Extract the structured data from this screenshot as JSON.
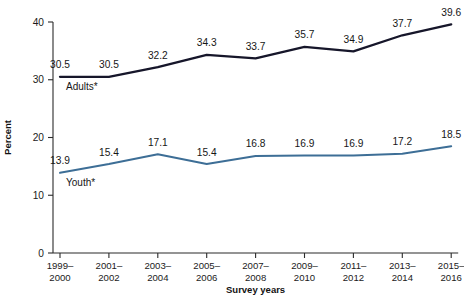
{
  "chart_data": {
    "type": "line",
    "title": "",
    "xlabel": "Survey years",
    "ylabel": "Percent",
    "ylim": [
      0,
      40
    ],
    "yticks": [
      0,
      10,
      20,
      30,
      40
    ],
    "grid": false,
    "legend_position": "inline-labels",
    "categories": [
      "1999–2000",
      "2001–2002",
      "2003–2004",
      "2005–2006",
      "2007–2008",
      "2009–2010",
      "2011–2012",
      "2013–2014",
      "2015–2016"
    ],
    "categories_lines": [
      [
        "1999–",
        "2000"
      ],
      [
        "2001–",
        "2002"
      ],
      [
        "2003–",
        "2004"
      ],
      [
        "2005–",
        "2006"
      ],
      [
        "2007–",
        "2008"
      ],
      [
        "2009–",
        "2010"
      ],
      [
        "2011–",
        "2012"
      ],
      [
        "2013–",
        "2014"
      ],
      [
        "2015–",
        "2016"
      ]
    ],
    "series": [
      {
        "name": "Adults*",
        "color": "#16162a",
        "values": [
          30.5,
          30.5,
          32.2,
          34.3,
          33.7,
          35.7,
          34.9,
          37.7,
          39.6
        ],
        "labels": [
          "30.5",
          "30.5",
          "32.2",
          "34.3",
          "33.7",
          "35.7",
          "34.9",
          "37.7",
          "39.6"
        ]
      },
      {
        "name": "Youth*",
        "color": "#3d6e96",
        "values": [
          13.9,
          15.4,
          17.1,
          15.4,
          16.8,
          16.9,
          16.9,
          17.2,
          18.5
        ],
        "labels": [
          "13.9",
          "15.4",
          "17.1",
          "15.4",
          "16.8",
          "16.9",
          "16.9",
          "17.2",
          "18.5"
        ]
      }
    ],
    "ytick_labels": [
      "0",
      "10",
      "20",
      "30",
      "40"
    ]
  }
}
